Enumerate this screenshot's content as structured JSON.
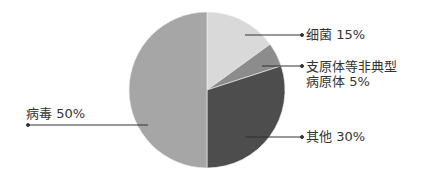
{
  "chart_data": {
    "type": "pie",
    "title": "",
    "start_angle": "12 o'clock, clockwise",
    "slices": [
      {
        "label": "细菌",
        "value": 15,
        "display": "细菌  15%",
        "color": "#d9d9d9"
      },
      {
        "label": "支原体等非典型病原体",
        "value": 5,
        "display_line1": "支原体等非典型",
        "display_line2": "病原体  5%",
        "color": "#8c8c8c"
      },
      {
        "label": "其他",
        "value": 30,
        "display": "其他  30%",
        "color": "#4d4d4d"
      },
      {
        "label": "病毒",
        "value": 50,
        "display": "病毒  50%",
        "color": "#a6a6a6"
      }
    ],
    "legend": "none (leader-line labels)"
  }
}
